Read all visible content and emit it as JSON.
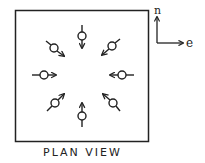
{
  "figure": {
    "caption": "PLAN VIEW",
    "compass": {
      "north_label": "n",
      "east_label": "e"
    },
    "stroke_color": "#222222",
    "background_color": "#ffffff",
    "symbols": [
      {
        "id": "north",
        "direction": "inward"
      },
      {
        "id": "north-east",
        "direction": "inward"
      },
      {
        "id": "east",
        "direction": "inward"
      },
      {
        "id": "south-east",
        "direction": "inward"
      },
      {
        "id": "south",
        "direction": "inward"
      },
      {
        "id": "south-west",
        "direction": "inward"
      },
      {
        "id": "west",
        "direction": "inward"
      },
      {
        "id": "north-west",
        "direction": "inward"
      }
    ]
  }
}
